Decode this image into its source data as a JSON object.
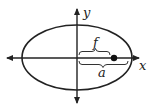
{
  "diagram": {
    "type": "ellipse-with-focus",
    "labels": {
      "y_axis": "y",
      "x_axis": "x",
      "focal_distance": "f",
      "semi_major_axis": "a"
    },
    "colors": {
      "stroke": "#222222",
      "background": "#ffffff"
    }
  }
}
